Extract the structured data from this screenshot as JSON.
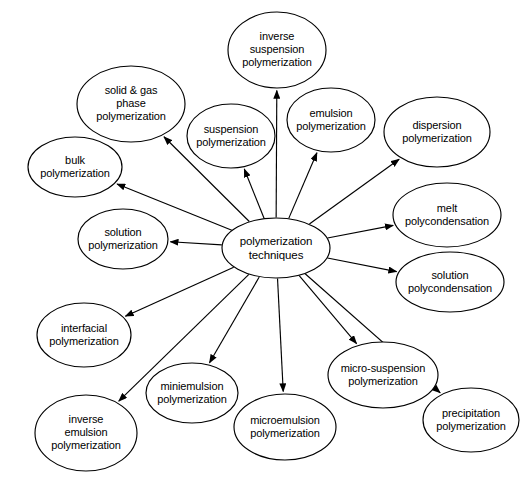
{
  "diagram": {
    "title": "polymerization techniques",
    "type": "radial-concept-map",
    "background_color": "#ffffff",
    "stroke_color": "#000000",
    "text_color": "#000000",
    "center": {
      "id": "center",
      "label": "polymerization\ntechniques",
      "cx": 276,
      "cy": 248,
      "rx": 54,
      "ry": 30
    },
    "nodes": [
      {
        "id": "solid-gas-phase-polymerization",
        "label": "solid & gas\nphase\npolymerization",
        "cx": 131,
        "cy": 104,
        "rx": 54,
        "ry": 38
      },
      {
        "id": "suspension-polymerization",
        "label": "suspension\npolymerization",
        "cx": 231,
        "cy": 136,
        "rx": 44,
        "ry": 32
      },
      {
        "id": "inverse-suspension-polymerization",
        "label": "inverse\nsuspension\npolymerization",
        "cx": 277,
        "cy": 50,
        "rx": 49,
        "ry": 38
      },
      {
        "id": "emulsion-polymerization",
        "label": "emulsion\npolymerization",
        "cx": 331,
        "cy": 120,
        "rx": 44,
        "ry": 32
      },
      {
        "id": "dispersion-polymerization",
        "label": "dispersion\npolymerization",
        "cx": 437,
        "cy": 132,
        "rx": 53,
        "ry": 35
      },
      {
        "id": "melt-polycondensation",
        "label": "melt\npolycondensation",
        "cx": 447,
        "cy": 215,
        "rx": 54,
        "ry": 32
      },
      {
        "id": "solution-polycondensation",
        "label": "solution\npolycondensation",
        "cx": 450,
        "cy": 282,
        "rx": 54,
        "ry": 30
      },
      {
        "id": "precipitation-polymerization",
        "label": "precipitation\npolymerization",
        "cx": 471,
        "cy": 420,
        "rx": 48,
        "ry": 32
      },
      {
        "id": "micro-suspension-polymerization",
        "label": "micro-suspension\npolymerization",
        "cx": 383,
        "cy": 375,
        "rx": 55,
        "ry": 33
      },
      {
        "id": "microemulsion-polymerization",
        "label": "microemulsion\npolymerization",
        "cx": 285,
        "cy": 427,
        "rx": 51,
        "ry": 33
      },
      {
        "id": "miniemulsion-polymerization",
        "label": "miniemulsion\npolymerization",
        "cx": 192,
        "cy": 393,
        "rx": 46,
        "ry": 30
      },
      {
        "id": "inverse-emulsion-polymerization",
        "label": "inverse\nemulsion\npolymerization",
        "cx": 86,
        "cy": 433,
        "rx": 51,
        "ry": 38
      },
      {
        "id": "interfacial-polymerization",
        "label": "interfacial\npolymerization",
        "cx": 84,
        "cy": 335,
        "rx": 47,
        "ry": 32
      },
      {
        "id": "solution-polymerization",
        "label": "solution\npolymerization",
        "cx": 123,
        "cy": 239,
        "rx": 45,
        "ry": 30
      },
      {
        "id": "bulk-polymerization",
        "label": "bulk\npolymerization",
        "cx": 75,
        "cy": 167,
        "rx": 47,
        "ry": 30
      }
    ],
    "edges": [
      {
        "from": "center",
        "to": "solid-gas-phase-polymerization"
      },
      {
        "from": "center",
        "to": "suspension-polymerization"
      },
      {
        "from": "center",
        "to": "inverse-suspension-polymerization"
      },
      {
        "from": "center",
        "to": "emulsion-polymerization"
      },
      {
        "from": "center",
        "to": "dispersion-polymerization"
      },
      {
        "from": "center",
        "to": "melt-polycondensation"
      },
      {
        "from": "center",
        "to": "solution-polycondensation"
      },
      {
        "from": "center",
        "to": "precipitation-polymerization"
      },
      {
        "from": "center",
        "to": "micro-suspension-polymerization"
      },
      {
        "from": "center",
        "to": "microemulsion-polymerization"
      },
      {
        "from": "center",
        "to": "miniemulsion-polymerization"
      },
      {
        "from": "center",
        "to": "inverse-emulsion-polymerization"
      },
      {
        "from": "center",
        "to": "interfacial-polymerization"
      },
      {
        "from": "center",
        "to": "solution-polymerization"
      },
      {
        "from": "center",
        "to": "bulk-polymerization"
      }
    ]
  }
}
